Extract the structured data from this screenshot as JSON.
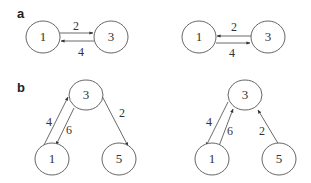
{
  "panels": [
    {
      "label": "a",
      "graphs": [
        {
          "nodes": [
            {
              "id": "1",
              "label": "1",
              "cx": 43,
              "cy": 37
            },
            {
              "id": "3",
              "label": "3",
              "cx": 111,
              "cy": 37
            }
          ],
          "edges": [
            {
              "from": "1",
              "to": "3",
              "weight": "2"
            },
            {
              "from": "3",
              "to": "1",
              "weight": "4"
            }
          ]
        },
        {
          "nodes": [
            {
              "id": "1",
              "label": "1",
              "cx": 199,
              "cy": 37
            },
            {
              "id": "3",
              "label": "3",
              "cx": 268,
              "cy": 37
            }
          ],
          "edges": [
            {
              "from": "3",
              "to": "1",
              "weight": "2"
            },
            {
              "from": "1",
              "to": "3",
              "weight": "4"
            }
          ]
        }
      ]
    },
    {
      "label": "b",
      "graphs": [
        {
          "nodes": [
            {
              "id": "3",
              "label": "3",
              "cx": 86,
              "cy": 95
            },
            {
              "id": "1",
              "label": "1",
              "cx": 52,
              "cy": 159
            },
            {
              "id": "5",
              "label": "5",
              "cx": 119,
              "cy": 159
            }
          ],
          "edges": [
            {
              "from": "1",
              "to": "3",
              "weight": "4"
            },
            {
              "from": "3",
              "to": "1",
              "weight": "6"
            },
            {
              "from": "3",
              "to": "5",
              "weight": "2"
            }
          ]
        },
        {
          "nodes": [
            {
              "id": "3",
              "label": "3",
              "cx": 245,
              "cy": 95
            },
            {
              "id": "1",
              "label": "1",
              "cx": 212,
              "cy": 159
            },
            {
              "id": "5",
              "label": "5",
              "cx": 279,
              "cy": 159
            }
          ],
          "edges": [
            {
              "from": "3",
              "to": "1",
              "weight": "4"
            },
            {
              "from": "1",
              "to": "3",
              "weight": "6"
            },
            {
              "from": "5",
              "to": "3",
              "weight": "2"
            }
          ]
        }
      ]
    }
  ]
}
